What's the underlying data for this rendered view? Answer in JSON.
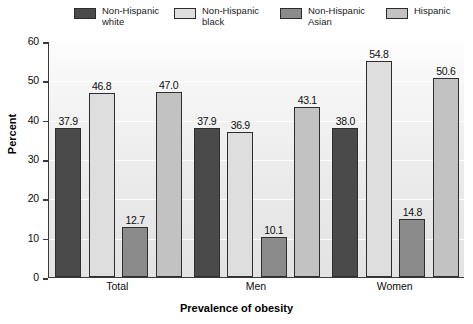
{
  "chart_data": {
    "type": "bar",
    "title": "",
    "xlabel": "Prevalence of obesity",
    "ylabel": "Percent",
    "ylim": [
      0,
      60
    ],
    "yticks": [
      0,
      10,
      20,
      30,
      40,
      50,
      60
    ],
    "grid": true,
    "legend_position": "top",
    "categories": [
      "Total",
      "Men",
      "Women"
    ],
    "series": [
      {
        "name": "Non-Hispanic white",
        "color": "#4a4a4a",
        "values": [
          37.9,
          37.9,
          38.0
        ],
        "labels": [
          "37.9",
          "37.9",
          "38.0"
        ]
      },
      {
        "name": "Non-Hispanic black",
        "color": "#dedede",
        "values": [
          46.8,
          36.9,
          54.8
        ],
        "labels": [
          "46.8",
          "36.9",
          "54.8"
        ]
      },
      {
        "name": "Non-Hispanic Asian",
        "color": "#8b8b8b",
        "values": [
          12.7,
          10.1,
          14.8
        ],
        "labels": [
          "12.7",
          "10.1",
          "14.8"
        ]
      },
      {
        "name": "Hispanic",
        "color": "#c2c2c2",
        "values": [
          47.0,
          43.1,
          50.6
        ],
        "labels": [
          "47.0",
          "43.1",
          "50.6"
        ]
      }
    ]
  },
  "legend": {
    "items": [
      {
        "label": "Non-Hispanic\nwhite",
        "color": "#4a4a4a"
      },
      {
        "label": "Non-Hispanic\nblack",
        "color": "#dedede"
      },
      {
        "label": "Non-Hispanic\nAsian",
        "color": "#8b8b8b"
      },
      {
        "label": "Hispanic",
        "color": "#c2c2c2"
      }
    ]
  },
  "axes": {
    "y_label": "Percent",
    "x_label": "Prevalence of obesity",
    "y_ticks": [
      "60",
      "50",
      "40",
      "30",
      "20",
      "10",
      "0"
    ],
    "x_ticks": [
      "Total",
      "Men",
      "Women"
    ]
  }
}
